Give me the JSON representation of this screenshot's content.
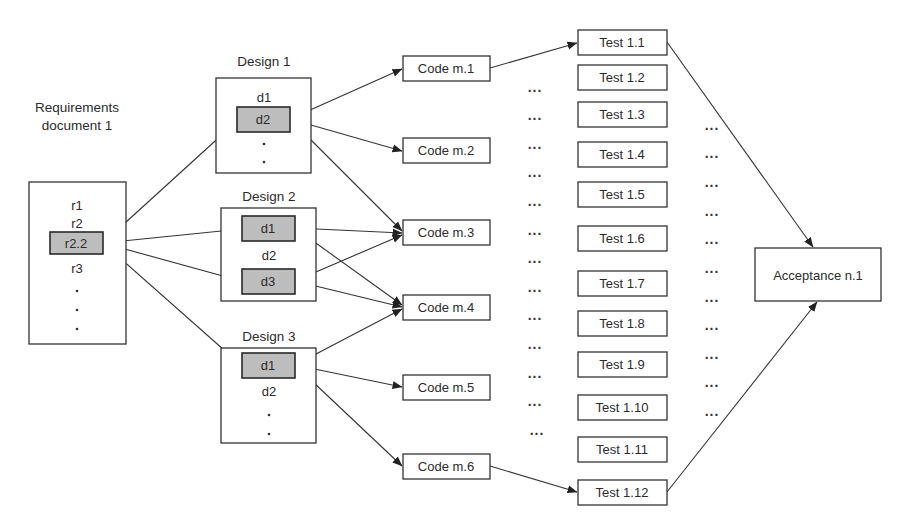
{
  "requirements": {
    "title_line1": "Requirements",
    "title_line2": "document 1",
    "items": [
      "r1",
      "r2",
      "r2.2",
      "r3"
    ],
    "highlighted": "r2.2",
    "continuation": "."
  },
  "designs": [
    {
      "title": "Design 1",
      "items": [
        "d1",
        "d2"
      ],
      "highlighted": [
        "d2"
      ],
      "continuation": "."
    },
    {
      "title": "Design 2",
      "items": [
        "d1",
        "d2",
        "d3"
      ],
      "highlighted": [
        "d1",
        "d3"
      ]
    },
    {
      "title": "Design 3",
      "items": [
        "d1",
        "d2"
      ],
      "highlighted": [
        "d1"
      ],
      "continuation": "."
    }
  ],
  "code": [
    "Code m.1",
    "Code m.2",
    "Code m.3",
    "Code m.4",
    "Code m.5",
    "Code m.6"
  ],
  "tests": [
    "Test 1.1",
    "Test 1.2",
    "Test 1.3",
    "Test 1.4",
    "Test 1.5",
    "Test 1.6",
    "Test 1.7",
    "Test 1.8",
    "Test 1.9",
    "Test 1.10",
    "Test 1.11",
    "Test 1.12"
  ],
  "acceptance": {
    "label": "Acceptance n.1"
  },
  "ellipsis": "...",
  "edges": [
    {
      "from": "Requirements r2.2",
      "to": "Design 1 d2"
    },
    {
      "from": "Requirements r2.2",
      "to": "Design 2 d1"
    },
    {
      "from": "Requirements r2.2",
      "to": "Design 2 d3"
    },
    {
      "from": "Requirements r2.2",
      "to": "Design 3 d1"
    },
    {
      "from": "Design 1 d2",
      "to": "Code m.1"
    },
    {
      "from": "Design 1 d2",
      "to": "Code m.2"
    },
    {
      "from": "Design 1 d2",
      "to": "Code m.3"
    },
    {
      "from": "Design 2 d1",
      "to": "Code m.3"
    },
    {
      "from": "Design 2 d1",
      "to": "Code m.4"
    },
    {
      "from": "Design 2 d3",
      "to": "Code m.3"
    },
    {
      "from": "Design 2 d3",
      "to": "Code m.4"
    },
    {
      "from": "Design 3 d1",
      "to": "Code m.4"
    },
    {
      "from": "Design 3 d1",
      "to": "Code m.5"
    },
    {
      "from": "Design 3 d1",
      "to": "Code m.6"
    },
    {
      "from": "Code m.1",
      "to": "Test 1.1"
    },
    {
      "from": "Code m.6",
      "to": "Test 1.12"
    },
    {
      "from": "Test 1.1",
      "to": "Acceptance n.1"
    },
    {
      "from": "Test 1.12",
      "to": "Acceptance n.1"
    }
  ]
}
